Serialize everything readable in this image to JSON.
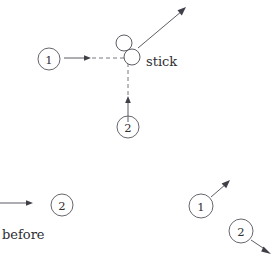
{
  "figure": {
    "width": 275,
    "height": 255,
    "background_color": "#ffffff",
    "line_color": "#4a4a52",
    "text_color": "#2e2e34",
    "dashed_color": "#6a6a72"
  },
  "labels": {
    "stick": "stick",
    "before": "before"
  },
  "before_state": {
    "caption": "before",
    "ball_one": {
      "label": "1",
      "cx": 49,
      "cy": 59,
      "r": 11,
      "velocity_direction": "right",
      "arrow": {
        "x1": 64,
        "y1": 58,
        "x2": 88,
        "y2": 58
      },
      "dashed_path": {
        "x1": 88,
        "y1": 58,
        "x2": 128,
        "y2": 58
      }
    },
    "ball_two": {
      "label": "2",
      "cx": 128,
      "cy": 127,
      "r": 11,
      "velocity_direction": "up",
      "arrow": {
        "x1": 128,
        "y1": 122,
        "x2": 128,
        "y2": 98
      },
      "dashed_path": {
        "x1": 128,
        "y1": 98,
        "x2": 128,
        "y2": 60
      }
    },
    "left_edge_arrow": {
      "x1": 0,
      "y1": 203,
      "x2": 32,
      "y2": 203
    },
    "lower_ball_two": {
      "label": "2",
      "cx": 62,
      "cy": 205,
      "r": 11
    }
  },
  "collision": {
    "stick_label": "stick",
    "small_ball_upper": {
      "cx": 124,
      "cy": 43,
      "r": 8
    },
    "small_ball_lower": {
      "cx": 132,
      "cy": 57,
      "r": 8
    },
    "outgoing_arrow": {
      "x1": 138,
      "y1": 47,
      "x2": 185,
      "y2": 8
    }
  },
  "after_state": {
    "ball_one": {
      "label": "1",
      "cx": 201,
      "cy": 206,
      "r": 12,
      "velocity_direction": "up-right",
      "arrow": {
        "x1": 212,
        "y1": 196,
        "x2": 228,
        "y2": 182
      }
    },
    "ball_two": {
      "label": "2",
      "cx": 241,
      "cy": 231,
      "r": 12,
      "velocity_direction": "down-right",
      "arrow": {
        "x1": 252,
        "y1": 241,
        "x2": 270,
        "y2": 254
      }
    }
  }
}
